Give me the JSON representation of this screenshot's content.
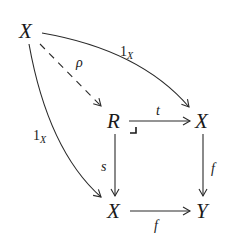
{
  "diagram": {
    "type": "commutative-diagram",
    "nodes": {
      "top_left": "X",
      "pullback": "R",
      "top_right": "X",
      "bottom_left": "X",
      "bottom_right": "Y"
    },
    "arrows": {
      "rho": {
        "from": "top_left",
        "to": "pullback",
        "label": "ρ",
        "style": "dashed"
      },
      "id_top": {
        "from": "top_left",
        "to": "top_right",
        "label_main": "1",
        "label_sub": "X",
        "style": "curved"
      },
      "id_left": {
        "from": "top_left",
        "to": "bottom_left",
        "label_main": "1",
        "label_sub": "X",
        "style": "curved"
      },
      "t": {
        "from": "pullback",
        "to": "top_right",
        "label": "t"
      },
      "s": {
        "from": "pullback",
        "to": "bottom_left",
        "label": "s"
      },
      "f_right": {
        "from": "top_right",
        "to": "bottom_right",
        "label": "f"
      },
      "f_bottom": {
        "from": "bottom_left",
        "to": "bottom_right",
        "label": "f"
      }
    },
    "pullback_corner": "⌟"
  }
}
